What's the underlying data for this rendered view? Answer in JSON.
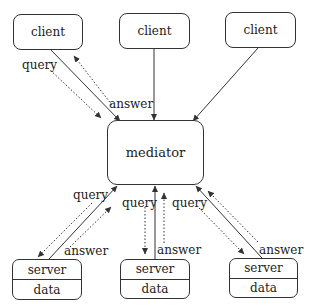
{
  "diagram": {
    "clients": [
      {
        "label": "client"
      },
      {
        "label": "client"
      },
      {
        "label": "client"
      }
    ],
    "mediator": {
      "label": "mediator"
    },
    "servers": [
      {
        "label": "server",
        "store": "data"
      },
      {
        "label": "server",
        "store": "data"
      },
      {
        "label": "server",
        "store": "data"
      }
    ],
    "edge_labels": {
      "client1_query": "query",
      "client1_answer": "answer",
      "server1_query": "query",
      "server1_answer": "answer",
      "server2_query": "query",
      "server2_answer": "answer",
      "server3_query": "query",
      "server3_answer": "answer"
    },
    "colors": {
      "stroke": "#333333",
      "text": "#222222",
      "background": "#ffffff"
    }
  }
}
